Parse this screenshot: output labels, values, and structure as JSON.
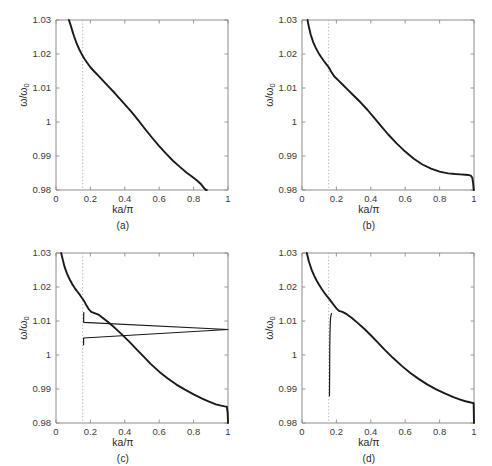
{
  "figure": {
    "background": "#ffffff",
    "curve_color": "#1a1a1a",
    "axis_color": "#8c8c8c",
    "marker_color": "#b0b0b0",
    "panel_count": 4
  },
  "axes": {
    "xlabel": "ka/π",
    "ylabel_main": "ω/ω",
    "ylabel_sub": "0",
    "xticks": [
      "0",
      "0.2",
      "0.4",
      "0.6",
      "0.8",
      "1"
    ],
    "xtick_values": [
      0,
      0.2,
      0.4,
      0.6,
      0.8,
      1
    ],
    "yticks": [
      "0.98",
      "0.99",
      "1",
      "1.01",
      "1.02",
      "1.03"
    ],
    "ytick_values": [
      0.98,
      0.99,
      1,
      1.01,
      1.02,
      1.03
    ],
    "xlim": [
      0,
      1
    ],
    "ylim": [
      0.98,
      1.03
    ],
    "grid": false,
    "marker_line_x": 0.155
  },
  "captions": {
    "a": "(a)",
    "b": "(b)",
    "c": "(c)",
    "d": "(d)"
  },
  "chart_data": [
    {
      "type": "line",
      "title": "(a)",
      "xlabel": "ka/π",
      "ylabel": "ω/ω₀",
      "xlim": [
        0,
        1
      ],
      "ylim": [
        0.98,
        1.03
      ],
      "grid": false,
      "legend": "none",
      "annotations": [
        {
          "kind": "vertical-dotted-line",
          "x": 0.155,
          "label": "ka/π = 0.155"
        }
      ],
      "series": [
        {
          "name": "band-1",
          "x": [
            0.075,
            0.085,
            0.095,
            0.105,
            0.12,
            0.135,
            0.15,
            0.165,
            0.18,
            0.2,
            0.22,
            0.25,
            0.28,
            0.31,
            0.34,
            0.37,
            0.4,
            0.44,
            0.48,
            0.52,
            0.56,
            0.6,
            0.64,
            0.68,
            0.72,
            0.76,
            0.79,
            0.82,
            0.845,
            0.862,
            0.872,
            0.877
          ],
          "y": [
            1.03,
            1.0285,
            1.0268,
            1.0252,
            1.0231,
            1.0214,
            1.0199,
            1.0186,
            1.0175,
            1.0161,
            1.015,
            1.0134,
            1.0118,
            1.0102,
            1.0086,
            1.0069,
            1.0052,
            1.0029,
            1.0004,
            0.9978,
            0.9953,
            0.9929,
            0.9907,
            0.9886,
            0.9868,
            0.9851,
            0.984,
            0.9828,
            0.9816,
            0.9805,
            0.9792,
            0.98
          ]
        }
      ]
    },
    {
      "type": "line",
      "title": "(b)",
      "xlabel": "ka/π",
      "ylabel": "ω/ω₀",
      "xlim": [
        0,
        1
      ],
      "ylim": [
        0.98,
        1.03
      ],
      "grid": false,
      "legend": "none",
      "annotations": [
        {
          "kind": "vertical-dotted-line",
          "x": 0.155,
          "label": "ka/π = 0.155"
        }
      ],
      "series": [
        {
          "name": "band-1",
          "x": [
            0.032,
            0.04,
            0.05,
            0.065,
            0.08,
            0.095,
            0.11,
            0.125,
            0.14,
            0.155,
            0.17,
            0.185,
            0.196,
            0.21,
            0.24,
            0.27,
            0.3,
            0.34,
            0.38,
            0.42,
            0.46,
            0.5,
            0.55,
            0.6,
            0.65,
            0.7,
            0.75,
            0.8,
            0.85,
            0.89,
            0.92,
            0.95,
            0.97,
            0.982,
            0.99,
            0.995,
            0.998,
            1.0
          ],
          "y": [
            1.03,
            1.028,
            1.0258,
            1.0235,
            1.0218,
            1.0204,
            1.0192,
            1.0181,
            1.0171,
            1.0161,
            1.0148,
            1.0136,
            1.013,
            1.0123,
            1.0108,
            1.0093,
            1.0078,
            1.0058,
            1.0036,
            1.0012,
            0.9988,
            0.9964,
            0.9937,
            0.9913,
            0.9892,
            0.9875,
            0.9863,
            0.9854,
            0.9849,
            0.9847,
            0.9846,
            0.9845,
            0.9844,
            0.9842,
            0.9836,
            0.982,
            0.98,
            0.98
          ]
        }
      ]
    },
    {
      "type": "line",
      "title": "(c)",
      "xlabel": "ka/π",
      "ylabel": "ω/ω₀",
      "xlim": [
        0,
        1
      ],
      "ylim": [
        0.98,
        1.03
      ],
      "grid": false,
      "legend": "none",
      "annotations": [
        {
          "kind": "vertical-dotted-line",
          "x": 0.155,
          "label": "ka/π = 0.155"
        }
      ],
      "series": [
        {
          "name": "upper-branch",
          "x": [
            0.03,
            0.04,
            0.05,
            0.065,
            0.08,
            0.095,
            0.11,
            0.125,
            0.14,
            0.152,
            0.162,
            0.175,
            0.19,
            0.205,
            0.22,
            0.25,
            0.28,
            0.31,
            0.35,
            0.39,
            0.43,
            0.47,
            0.51,
            0.55,
            0.6,
            0.65,
            0.7,
            0.75,
            0.8,
            0.85,
            0.89,
            0.93,
            0.96,
            0.98,
            0.993,
            0.998,
            1.0
          ],
          "y": [
            1.03,
            1.0279,
            1.0259,
            1.0238,
            1.0222,
            1.0208,
            1.0196,
            1.0186,
            1.0176,
            1.0167,
            1.016,
            1.0148,
            1.0135,
            1.0127,
            1.0124,
            1.0118,
            1.0106,
            1.0094,
            1.0076,
            1.0057,
            1.0037,
            1.0016,
            0.9995,
            0.9974,
            0.9951,
            0.9931,
            0.9913,
            0.9898,
            0.9884,
            0.9872,
            0.9863,
            0.9855,
            0.9851,
            0.9849,
            0.9848,
            0.983,
            0.98
          ]
        },
        {
          "name": "lower-branch-drop",
          "x": [
            0.162,
            0.1615,
            0.161,
            0.1608,
            1.606,
            0.1605,
            0.1604,
            0.1603
          ],
          "y": [
            1.0125,
            1.0122,
            1.0112,
            1.0096,
            1.0075,
            1.005,
            1.0035,
            1.003
          ]
        }
      ]
    },
    {
      "type": "line",
      "title": "(d)",
      "xlabel": "ka/π",
      "ylabel": "ω/ω₀",
      "xlim": [
        0,
        1
      ],
      "ylim": [
        0.98,
        1.03
      ],
      "grid": false,
      "legend": "none",
      "annotations": [
        {
          "kind": "vertical-dotted-line",
          "x": 0.155,
          "label": "ka/π = 0.155"
        }
      ],
      "series": [
        {
          "name": "upper-branch",
          "x": [
            0.028,
            0.04,
            0.055,
            0.07,
            0.085,
            0.1,
            0.115,
            0.13,
            0.145,
            0.158,
            0.17,
            0.185,
            0.2,
            0.215,
            0.235,
            0.26,
            0.29,
            0.32,
            0.36,
            0.4,
            0.44,
            0.48,
            0.53,
            0.58,
            0.63,
            0.68,
            0.73,
            0.78,
            0.83,
            0.88,
            0.92,
            0.95,
            0.975,
            0.99,
            0.998,
            1.0
          ],
          "y": [
            1.03,
            1.0275,
            1.0252,
            1.0234,
            1.0219,
            1.0206,
            1.0194,
            1.0183,
            1.0173,
            1.0165,
            1.0157,
            1.0147,
            1.0137,
            1.013,
            1.0127,
            1.012,
            1.0109,
            1.0096,
            1.0078,
            1.0058,
            1.0037,
            1.0016,
            0.9991,
            0.9968,
            0.9947,
            0.9929,
            0.9913,
            0.9899,
            0.9887,
            0.9876,
            0.9869,
            0.9864,
            0.9861,
            0.9859,
            0.9858,
            0.98
          ]
        },
        {
          "name": "lower-branch-drop",
          "x": [
            0.172,
            0.169,
            0.166,
            0.164,
            0.1625,
            0.1615,
            0.161,
            0.1605,
            0.16,
            0.1598,
            0.1596
          ],
          "y": [
            1.0122,
            1.0118,
            1.0108,
            1.009,
            1.006,
            1.002,
            0.9975,
            0.9935,
            0.9905,
            0.9888,
            0.988
          ]
        }
      ]
    }
  ]
}
